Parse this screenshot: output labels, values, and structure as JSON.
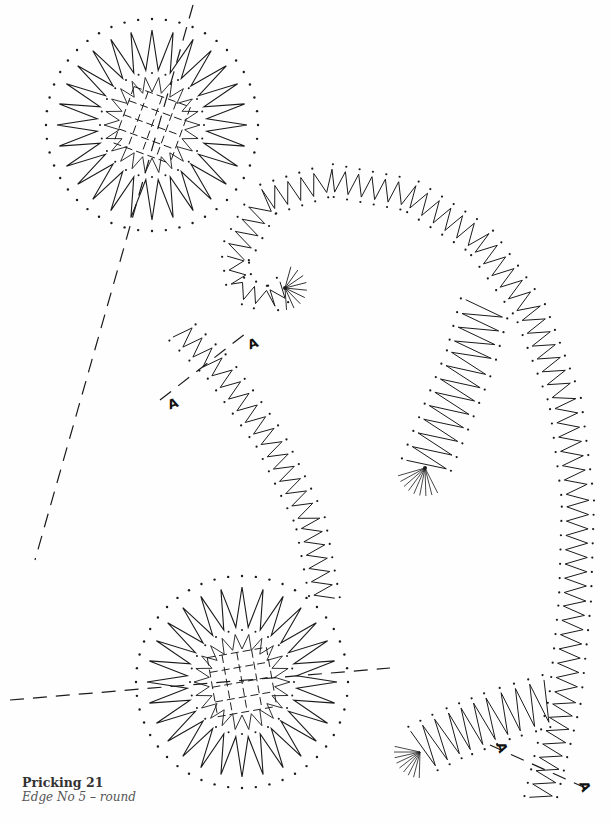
{
  "caption": {
    "title": "Pricking 21",
    "subtitle": "Edge No 5 – round"
  },
  "markers": [
    {
      "label": "A",
      "x": 248,
      "y": 341,
      "rot": -20
    },
    {
      "label": "A",
      "x": 168,
      "y": 401,
      "rot": -20
    },
    {
      "label": "A",
      "x": 497,
      "y": 745,
      "rot": 70
    },
    {
      "label": "A",
      "x": 580,
      "y": 784,
      "rot": 70
    }
  ],
  "colors": {
    "ink": "#1a1a1a",
    "paper": "#fefefe"
  }
}
